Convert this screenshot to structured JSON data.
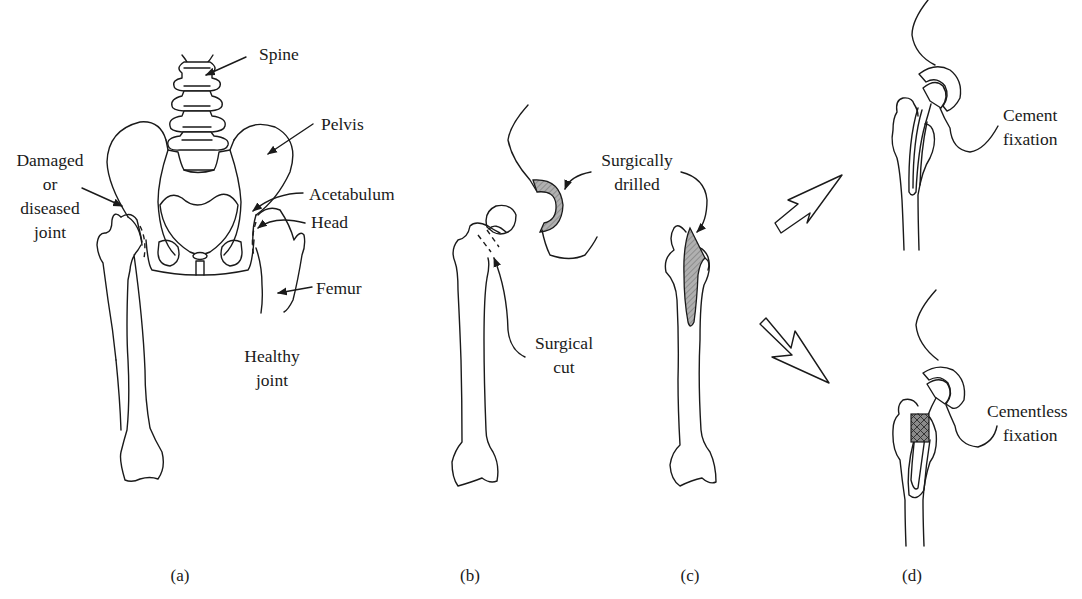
{
  "figure": {
    "panels": [
      {
        "id": "a",
        "caption": "(a)",
        "labels": {
          "spine": "Spine",
          "pelvis": "Pelvis",
          "damaged_1": "Damaged",
          "damaged_2": "or",
          "damaged_3": "diseased",
          "damaged_4": "joint",
          "acetabulum": "Acetabulum",
          "head": "Head",
          "femur": "Femur",
          "healthy_1": "Healthy",
          "healthy_2": "joint"
        }
      },
      {
        "id": "b",
        "caption": "(b)",
        "labels": {
          "surgical_cut_1": "Surgical",
          "surgical_cut_2": "cut"
        }
      },
      {
        "id": "c",
        "caption": "(c)",
        "labels": {
          "drilled_1": "Surgically",
          "drilled_2": "drilled"
        }
      },
      {
        "id": "d",
        "caption": "(d)",
        "labels": {
          "cement_1": "Cement",
          "cement_2": "fixation",
          "cementless_1": "Cementless",
          "cementless_2": "fixation"
        }
      }
    ],
    "colors": {
      "line": "#1a1a1a",
      "drilled_fill": "#a8a8a8",
      "mesh_fill": "#7a7a7a",
      "background": "#ffffff"
    }
  }
}
